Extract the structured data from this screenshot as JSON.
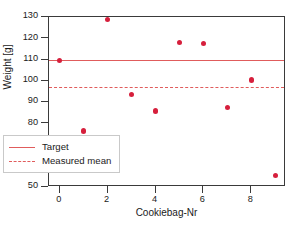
{
  "chart_data": {
    "type": "scatter",
    "title": "",
    "xlabel": "Cookiebag-Nr",
    "ylabel": "Weight [g]",
    "xlim": [
      -0.45,
      9.45
    ],
    "ylim": [
      50,
      130
    ],
    "grid": false,
    "legend_position": "lower-left",
    "x": [
      0,
      1,
      2,
      3,
      4,
      5,
      6,
      7,
      8,
      9
    ],
    "values": [
      109.5,
      76.3,
      128.7,
      93.6,
      85.7,
      118.0,
      117.4,
      87.5,
      100.4,
      55.3
    ],
    "series": [
      {
        "name": "Weight measurements",
        "type": "scatter",
        "color": "#d61f3c",
        "x": [
          0,
          1,
          2,
          3,
          4,
          5,
          6,
          7,
          8,
          9
        ],
        "values": [
          109.5,
          76.3,
          128.7,
          93.6,
          85.7,
          118.0,
          117.4,
          87.5,
          100.4,
          55.3
        ]
      }
    ],
    "reference_lines": [
      {
        "name": "Target",
        "value": 110.0,
        "style": "solid",
        "color": "#e05c5c"
      },
      {
        "name": "Measured mean",
        "value": 97.0,
        "style": "dashed",
        "color": "#e05c5c"
      }
    ],
    "xticks": [
      0,
      2,
      4,
      6,
      8
    ],
    "xtick_labels": [
      "0",
      "2",
      "4",
      "6",
      "8"
    ],
    "yticks": [
      50,
      60,
      70,
      80,
      90,
      100,
      110,
      120,
      130
    ],
    "ytick_labels": [
      "50",
      "60",
      "70",
      "80",
      "90",
      "100",
      "110",
      "120",
      "130"
    ],
    "legend": [
      {
        "label": "Target",
        "style": "solid",
        "color": "#e05c5c"
      },
      {
        "label": "Measured mean",
        "style": "dashed",
        "color": "#e05c5c"
      }
    ],
    "colors": {
      "marker": "#d61f3c",
      "reference": "#e05c5c",
      "axis": "#3a3a3a",
      "text": "#1a1a1a",
      "background": "#ffffff",
      "legend_border": "#c9c9c9"
    }
  }
}
